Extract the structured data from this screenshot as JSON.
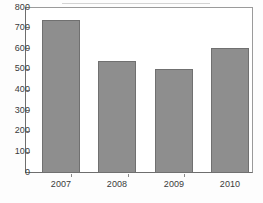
{
  "chart_data": {
    "type": "bar",
    "title": "",
    "subtitle": "",
    "xlabel": "",
    "ylabel": "",
    "categories": [
      "2007",
      "2008",
      "2009",
      "2010"
    ],
    "values": [
      740,
      542,
      505,
      608
    ],
    "series": [
      {
        "name": "",
        "values": [
          740,
          542,
          505,
          608
        ]
      }
    ],
    "ylim": [
      0,
      800
    ],
    "y_ticks": [
      0,
      100,
      200,
      300,
      400,
      500,
      600,
      700,
      800
    ],
    "y_tick_labels": [
      "0",
      "100",
      "200",
      "300",
      "400",
      "500",
      "600",
      "700",
      "800"
    ],
    "x_tick_labels": [
      "2007",
      "2008",
      "2009",
      "2010"
    ],
    "grid": false,
    "legend": false,
    "legend_position": "none",
    "bar_color": "#8e8e8e",
    "bar_edge_color": "#707070",
    "plot_background": "#ffffff",
    "axis_color": "#6e6e6e",
    "text_color": "#3b3b3b"
  }
}
